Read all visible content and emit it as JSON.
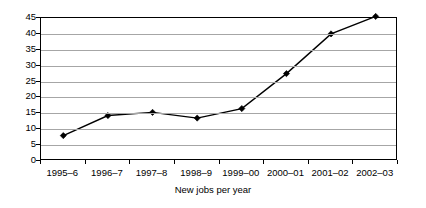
{
  "chart_data": {
    "type": "line",
    "title": "",
    "xlabel": "New jobs per year",
    "ylabel": "",
    "categories": [
      "1995–6",
      "1996–7",
      "1997–8",
      "1998–9",
      "1999–00",
      "2000–01",
      "2001–02",
      "2002–03"
    ],
    "values": [
      8,
      14.3,
      15.3,
      13.5,
      16.5,
      27.5,
      40,
      45.5
    ],
    "series": [
      {
        "name": "New jobs",
        "values": [
          8,
          14.3,
          15.3,
          13.5,
          16.5,
          27.5,
          40,
          45.5
        ]
      }
    ],
    "ylim": [
      0,
      45
    ],
    "yticks": [
      0,
      5,
      10,
      15,
      20,
      25,
      30,
      35,
      40,
      45
    ],
    "ytick_labels": [
      "0",
      "5",
      "10",
      "15",
      "20",
      "25",
      "30",
      "35",
      "40",
      "45"
    ],
    "grid": true,
    "legend": false,
    "legend_position": "none",
    "marker": "diamond",
    "line_color": "#000000",
    "marker_color": "#000000",
    "grid_color": "#a6a6a6",
    "axis_color": "#000000",
    "background_color": "#ffffff"
  }
}
